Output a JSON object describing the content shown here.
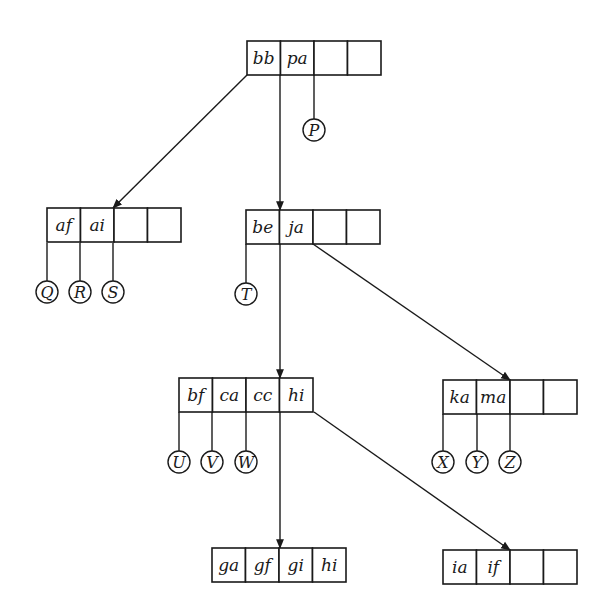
{
  "diagram": {
    "type": "tree",
    "cell_width": 33.5,
    "cell_height": 34,
    "nodes": [
      {
        "id": "root",
        "x": 247,
        "y": 41,
        "keys": [
          "bb",
          "pa",
          "",
          ""
        ]
      },
      {
        "id": "n_af",
        "x": 47,
        "y": 208,
        "keys": [
          "af",
          "ai",
          "",
          ""
        ]
      },
      {
        "id": "n_be",
        "x": 246,
        "y": 210,
        "keys": [
          "be",
          "ja",
          "",
          ""
        ]
      },
      {
        "id": "n_bf",
        "x": 179,
        "y": 378,
        "keys": [
          "bf",
          "ca",
          "cc",
          "hi"
        ]
      },
      {
        "id": "n_ka",
        "x": 443,
        "y": 380,
        "keys": [
          "ka",
          "ma",
          "",
          ""
        ]
      },
      {
        "id": "n_ga",
        "x": 212,
        "y": 548,
        "keys": [
          "ga",
          "gf",
          "gi",
          "hi"
        ]
      },
      {
        "id": "n_ia",
        "x": 443,
        "y": 550,
        "keys": [
          "ia",
          "if",
          "",
          ""
        ]
      }
    ],
    "edges": [
      {
        "from": "root",
        "to": "n_af",
        "x1": 247,
        "y1": 75,
        "x2": 113,
        "y2": 208
      },
      {
        "from": "root",
        "to": "n_be",
        "x1": 280,
        "y1": 75,
        "x2": 280,
        "y2": 210
      },
      {
        "from": "n_be",
        "to": "n_bf",
        "x1": 280,
        "y1": 244,
        "x2": 280,
        "y2": 378
      },
      {
        "from": "n_be",
        "to": "n_ka",
        "x1": 313,
        "y1": 244,
        "x2": 510,
        "y2": 380
      },
      {
        "from": "n_bf",
        "to": "n_ga",
        "x1": 280,
        "y1": 412,
        "x2": 280,
        "y2": 548
      },
      {
        "from": "n_bf",
        "to": "n_ia",
        "x1": 314,
        "y1": 412,
        "x2": 510,
        "y2": 550
      }
    ],
    "leaves": [
      {
        "label": "P",
        "x": 314,
        "line_top": 75,
        "cy": 130
      },
      {
        "label": "Q",
        "x": 47,
        "line_top": 243,
        "cy": 292
      },
      {
        "label": "R",
        "x": 80,
        "line_top": 243,
        "cy": 292
      },
      {
        "label": "S",
        "x": 113,
        "line_top": 243,
        "cy": 292
      },
      {
        "label": "T",
        "x": 246,
        "line_top": 244,
        "cy": 294
      },
      {
        "label": "U",
        "x": 179,
        "line_top": 412,
        "cy": 462
      },
      {
        "label": "V",
        "x": 212,
        "line_top": 412,
        "cy": 462
      },
      {
        "label": "W",
        "x": 246,
        "line_top": 412,
        "cy": 462
      },
      {
        "label": "X",
        "x": 443,
        "line_top": 414,
        "cy": 462
      },
      {
        "label": "Y",
        "x": 477,
        "line_top": 414,
        "cy": 462
      },
      {
        "label": "Z",
        "x": 510,
        "line_top": 414,
        "cy": 462
      }
    ],
    "leaf_radius": 11,
    "colors": {
      "ink": "#1a1a1a",
      "background": "#ffffff"
    }
  }
}
